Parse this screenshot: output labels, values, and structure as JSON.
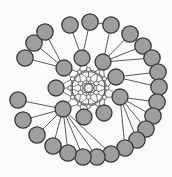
{
  "figure": {
    "name": "spiral-graph-diagram",
    "canvas": {
      "width": 172,
      "height": 177,
      "background": "#fbfbfa"
    },
    "styles": {
      "edge_color": "#474747",
      "edge_width": 0.9,
      "mesh_color": "#4a4a4a",
      "mesh_width": 0.75,
      "outer": {
        "fill": "#9e9e9e",
        "stroke": "#3a3a3a",
        "stroke_width": 1.3,
        "radius": 8.2
      },
      "hub": {
        "fill": "#9e9e9e",
        "stroke": "#3a3a3a",
        "stroke_width": 1.3,
        "radius": 8.0
      },
      "core": {
        "fill": "#f2f2f0",
        "stroke": "#4a4a4a",
        "stroke_width": 0.8
      }
    },
    "graph": {
      "nodes": [
        {
          "id": "c0",
          "x": 88.5,
          "y": 88,
          "r": 4.0,
          "kind": "core"
        },
        {
          "id": "a0",
          "x": 88.5,
          "y": 79,
          "r": 2.4,
          "kind": "core"
        },
        {
          "id": "a1",
          "x": 96.3,
          "y": 83.5,
          "r": 2.4,
          "kind": "core"
        },
        {
          "id": "a2",
          "x": 96.3,
          "y": 92.5,
          "r": 2.4,
          "kind": "core"
        },
        {
          "id": "a3",
          "x": 88.5,
          "y": 97,
          "r": 2.4,
          "kind": "core"
        },
        {
          "id": "a4",
          "x": 80.7,
          "y": 92.5,
          "r": 2.4,
          "kind": "core"
        },
        {
          "id": "a5",
          "x": 80.7,
          "y": 83.5,
          "r": 2.4,
          "kind": "core"
        },
        {
          "id": "b0",
          "x": 88.5,
          "y": 69.5,
          "r": 2.1,
          "kind": "core"
        },
        {
          "id": "b1",
          "x": 97.8,
          "y": 72.0,
          "r": 2.1,
          "kind": "core"
        },
        {
          "id": "b2",
          "x": 104.5,
          "y": 78.8,
          "r": 2.1,
          "kind": "core"
        },
        {
          "id": "b3",
          "x": 107.0,
          "y": 88.0,
          "r": 2.1,
          "kind": "core"
        },
        {
          "id": "b4",
          "x": 104.5,
          "y": 97.2,
          "r": 2.1,
          "kind": "core"
        },
        {
          "id": "b5",
          "x": 97.8,
          "y": 104.0,
          "r": 2.1,
          "kind": "core"
        },
        {
          "id": "b6",
          "x": 88.5,
          "y": 106.5,
          "r": 2.1,
          "kind": "core"
        },
        {
          "id": "b7",
          "x": 79.3,
          "y": 104.0,
          "r": 2.1,
          "kind": "core"
        },
        {
          "id": "b8",
          "x": 72.5,
          "y": 97.2,
          "r": 2.1,
          "kind": "core"
        },
        {
          "id": "b9",
          "x": 70.0,
          "y": 88.0,
          "r": 2.1,
          "kind": "core"
        },
        {
          "id": "b10",
          "x": 72.5,
          "y": 78.8,
          "r": 2.1,
          "kind": "core"
        },
        {
          "id": "b11",
          "x": 79.3,
          "y": 72.0,
          "r": 2.1,
          "kind": "core"
        },
        {
          "id": "g1",
          "x": 64,
          "y": 68,
          "r": 8,
          "kind": "hub"
        },
        {
          "id": "g2",
          "x": 82,
          "y": 58,
          "r": 8,
          "kind": "hub"
        },
        {
          "id": "g3",
          "x": 103,
          "y": 62,
          "r": 8,
          "kind": "hub"
        },
        {
          "id": "g4",
          "x": 116,
          "y": 77,
          "r": 8,
          "kind": "hub"
        },
        {
          "id": "g5",
          "x": 120,
          "y": 97,
          "r": 8,
          "kind": "hub"
        },
        {
          "id": "g6",
          "x": 104,
          "y": 113,
          "r": 8,
          "kind": "hub"
        },
        {
          "id": "g7",
          "x": 84,
          "y": 117,
          "r": 8,
          "kind": "hub"
        },
        {
          "id": "g8",
          "x": 63,
          "y": 109,
          "r": 8,
          "kind": "hub"
        },
        {
          "id": "g9",
          "x": 56,
          "y": 88,
          "r": 8,
          "kind": "hub"
        },
        {
          "id": "n1",
          "x": 25,
          "y": 58,
          "r": 8.2,
          "kind": "outer"
        },
        {
          "id": "n2",
          "x": 34,
          "y": 43,
          "r": 8.2,
          "kind": "outer"
        },
        {
          "id": "n3",
          "x": 45,
          "y": 32,
          "r": 8.2,
          "kind": "outer"
        },
        {
          "id": "n4",
          "x": 70,
          "y": 25,
          "r": 8.2,
          "kind": "outer"
        },
        {
          "id": "n5",
          "x": 90,
          "y": 22,
          "r": 8.2,
          "kind": "outer"
        },
        {
          "id": "n6",
          "x": 111,
          "y": 25,
          "r": 8.2,
          "kind": "outer"
        },
        {
          "id": "n7",
          "x": 130,
          "y": 34,
          "r": 8.2,
          "kind": "outer"
        },
        {
          "id": "n8",
          "x": 143,
          "y": 46,
          "r": 8.2,
          "kind": "outer"
        },
        {
          "id": "n9",
          "x": 152,
          "y": 58,
          "r": 8.2,
          "kind": "outer"
        },
        {
          "id": "n10",
          "x": 158,
          "y": 72,
          "r": 8.2,
          "kind": "outer"
        },
        {
          "id": "n11",
          "x": 159,
          "y": 87,
          "r": 8.2,
          "kind": "outer"
        },
        {
          "id": "n12",
          "x": 157,
          "y": 102,
          "r": 8.2,
          "kind": "outer"
        },
        {
          "id": "n13",
          "x": 153,
          "y": 116,
          "r": 8.2,
          "kind": "outer"
        },
        {
          "id": "n14",
          "x": 146,
          "y": 129,
          "r": 8.2,
          "kind": "outer"
        },
        {
          "id": "n15",
          "x": 137,
          "y": 140,
          "r": 8.2,
          "kind": "outer"
        },
        {
          "id": "n16",
          "x": 125,
          "y": 148,
          "r": 8.2,
          "kind": "outer"
        },
        {
          "id": "n17",
          "x": 111,
          "y": 154,
          "r": 8.2,
          "kind": "outer"
        },
        {
          "id": "n18",
          "x": 97,
          "y": 157,
          "r": 8.2,
          "kind": "outer"
        },
        {
          "id": "n19",
          "x": 83,
          "y": 157,
          "r": 8.2,
          "kind": "outer"
        },
        {
          "id": "n20",
          "x": 68,
          "y": 153,
          "r": 8.2,
          "kind": "outer"
        },
        {
          "id": "n21",
          "x": 53,
          "y": 146,
          "r": 8.2,
          "kind": "outer"
        },
        {
          "id": "n22",
          "x": 37,
          "y": 135,
          "r": 8.2,
          "kind": "outer"
        },
        {
          "id": "n23",
          "x": 23,
          "y": 120,
          "r": 8.2,
          "kind": "outer"
        },
        {
          "id": "n24",
          "x": 18,
          "y": 100,
          "r": 8.2,
          "kind": "outer"
        }
      ],
      "mesh_edges": [
        [
          "c0",
          "a0"
        ],
        [
          "c0",
          "a1"
        ],
        [
          "c0",
          "a2"
        ],
        [
          "c0",
          "a3"
        ],
        [
          "c0",
          "a4"
        ],
        [
          "c0",
          "a5"
        ],
        [
          "a0",
          "a1"
        ],
        [
          "a1",
          "a2"
        ],
        [
          "a2",
          "a3"
        ],
        [
          "a3",
          "a4"
        ],
        [
          "a4",
          "a5"
        ],
        [
          "a5",
          "a0"
        ],
        [
          "a0",
          "a2"
        ],
        [
          "a2",
          "a4"
        ],
        [
          "a4",
          "a0"
        ],
        [
          "a1",
          "a3"
        ],
        [
          "a3",
          "a5"
        ],
        [
          "a5",
          "a1"
        ],
        [
          "a0",
          "b11"
        ],
        [
          "a0",
          "b0"
        ],
        [
          "a0",
          "b1"
        ],
        [
          "a1",
          "b1"
        ],
        [
          "a1",
          "b2"
        ],
        [
          "a1",
          "b3"
        ],
        [
          "a2",
          "b3"
        ],
        [
          "a2",
          "b4"
        ],
        [
          "a2",
          "b5"
        ],
        [
          "a3",
          "b5"
        ],
        [
          "a3",
          "b6"
        ],
        [
          "a3",
          "b7"
        ],
        [
          "a4",
          "b7"
        ],
        [
          "a4",
          "b8"
        ],
        [
          "a4",
          "b9"
        ],
        [
          "a5",
          "b9"
        ],
        [
          "a5",
          "b10"
        ],
        [
          "a5",
          "b11"
        ],
        [
          "b0",
          "b1"
        ],
        [
          "b1",
          "b2"
        ],
        [
          "b2",
          "b3"
        ],
        [
          "b3",
          "b4"
        ],
        [
          "b4",
          "b5"
        ],
        [
          "b5",
          "b6"
        ],
        [
          "b6",
          "b7"
        ],
        [
          "b7",
          "b8"
        ],
        [
          "b8",
          "b9"
        ],
        [
          "b9",
          "b10"
        ],
        [
          "b10",
          "b11"
        ],
        [
          "b11",
          "b0"
        ],
        [
          "b0",
          "b2"
        ],
        [
          "b1",
          "b3"
        ],
        [
          "b2",
          "b4"
        ],
        [
          "b3",
          "b5"
        ],
        [
          "b4",
          "b6"
        ],
        [
          "b5",
          "b7"
        ],
        [
          "b6",
          "b8"
        ],
        [
          "b7",
          "b9"
        ],
        [
          "b8",
          "b10"
        ],
        [
          "b9",
          "b11"
        ],
        [
          "b10",
          "b0"
        ],
        [
          "b11",
          "b1"
        ],
        [
          "g1",
          "b11"
        ],
        [
          "g1",
          "b10"
        ],
        [
          "g2",
          "b0"
        ],
        [
          "g2",
          "b11"
        ],
        [
          "g3",
          "b1"
        ],
        [
          "g3",
          "b2"
        ],
        [
          "g4",
          "b2"
        ],
        [
          "g4",
          "b3"
        ],
        [
          "g5",
          "b3"
        ],
        [
          "g5",
          "b4"
        ],
        [
          "g6",
          "b4"
        ],
        [
          "g6",
          "b5"
        ],
        [
          "g7",
          "b6"
        ],
        [
          "g7",
          "b7"
        ],
        [
          "g8",
          "b7"
        ],
        [
          "g8",
          "b8"
        ],
        [
          "g9",
          "b8"
        ],
        [
          "g9",
          "b9"
        ],
        [
          "g9",
          "b10"
        ]
      ],
      "spoke_edges": [
        [
          "g1",
          "n1"
        ],
        [
          "g1",
          "n2"
        ],
        [
          "g1",
          "n3"
        ],
        [
          "g2",
          "n4"
        ],
        [
          "g2",
          "n5"
        ],
        [
          "g3",
          "n6"
        ],
        [
          "g3",
          "n7"
        ],
        [
          "g3",
          "n8"
        ],
        [
          "g3",
          "n9"
        ],
        [
          "g4",
          "n10"
        ],
        [
          "g4",
          "n11"
        ],
        [
          "g5",
          "n12"
        ],
        [
          "g5",
          "n13"
        ],
        [
          "g5",
          "n14"
        ],
        [
          "g5",
          "n15"
        ],
        [
          "g5",
          "n16"
        ],
        [
          "g8",
          "n17"
        ],
        [
          "g8",
          "n18"
        ],
        [
          "g8",
          "n19"
        ],
        [
          "g8",
          "n20"
        ],
        [
          "g8",
          "n21"
        ],
        [
          "g8",
          "n22"
        ],
        [
          "g8",
          "n23"
        ],
        [
          "g8",
          "n24"
        ]
      ],
      "chain_edges": [
        [
          "n5",
          "n6"
        ]
      ]
    }
  }
}
